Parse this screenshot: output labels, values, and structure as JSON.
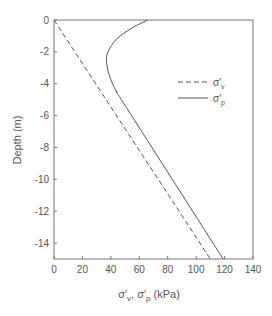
{
  "chart_data": {
    "type": "line",
    "title": "",
    "xlabel": "σ'v, σ'p (kPa)",
    "ylabel": "Depth (m)",
    "xlim": [
      0,
      140
    ],
    "ylim": [
      -15,
      0
    ],
    "x_ticks": [
      0,
      20,
      40,
      60,
      80,
      100,
      120,
      140
    ],
    "y_ticks": [
      0,
      -2,
      -4,
      -6,
      -8,
      -10,
      -12,
      -14
    ],
    "grid": false,
    "legend_position": "upper right",
    "series": [
      {
        "name": "σ'v",
        "style": "dashed",
        "points": [
          [
            0,
            0
          ],
          [
            110,
            -15
          ]
        ]
      },
      {
        "name": "σ'p",
        "style": "solid",
        "points": [
          [
            66,
            0
          ],
          [
            55,
            -0.5
          ],
          [
            44,
            -1.2
          ],
          [
            38,
            -2.0
          ],
          [
            37,
            -2.6
          ],
          [
            39,
            -3.5
          ],
          [
            44,
            -4.5
          ],
          [
            51,
            -5.5
          ],
          [
            119,
            -15
          ]
        ]
      }
    ]
  },
  "legend": {
    "items": [
      {
        "symbol": "σ'",
        "sub": "v"
      },
      {
        "symbol": "σ'",
        "sub": "p"
      }
    ]
  },
  "axes": {
    "xlabel_main1": "σ'",
    "xlabel_sub1": "v",
    "xlabel_sep": ", σ'",
    "xlabel_sub2": "p",
    "xlabel_unit": " (kPa)",
    "ylabel": "Depth (m)"
  }
}
